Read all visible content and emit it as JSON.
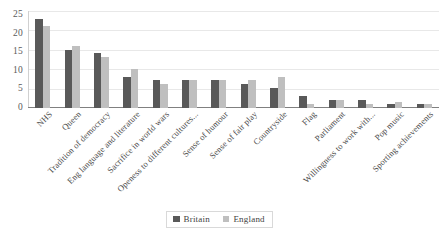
{
  "chart_data": {
    "type": "bar",
    "title": "",
    "xlabel": "",
    "ylabel": "",
    "ylim": [
      0,
      25
    ],
    "yticks": [
      0,
      5,
      10,
      15,
      20,
      25
    ],
    "grid": true,
    "legend_position": "bottom",
    "categories": [
      "NHS",
      "Queen",
      "Tradition of democracy",
      "Eng language and literature",
      "Sacrifice in world wars",
      "Openess to different cultures...",
      "Sense of humour",
      "Sense of fair play",
      "Countryside",
      "Flag",
      "Parliament",
      "Willingness to work with...",
      "Pop music",
      "Sporting achievements"
    ],
    "series": [
      {
        "name": "Britain",
        "color": "#595959",
        "values": [
          23,
          15,
          14,
          8,
          7,
          7,
          7,
          6,
          5,
          3,
          2,
          2,
          1,
          1
        ]
      },
      {
        "name": "England",
        "color": "#bfbfbf",
        "values": [
          21,
          16,
          13,
          10,
          6,
          7,
          7,
          7,
          8,
          1,
          2,
          1,
          1.5,
          1
        ]
      }
    ]
  },
  "legend": {
    "items": [
      {
        "label": "Britain",
        "color": "#595959"
      },
      {
        "label": "England",
        "color": "#bfbfbf"
      }
    ]
  }
}
